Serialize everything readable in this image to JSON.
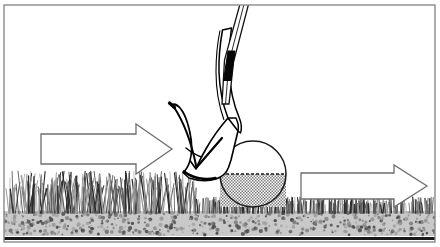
{
  "figure": {
    "kind": "illustration",
    "width": 440,
    "height": 247,
    "background_color": "#ffffff",
    "frame": {
      "label": "illustration-border",
      "stroke_color": "#8a8a8a",
      "stroke_width": 1.4,
      "x": 4,
      "y": 5,
      "width": 431,
      "height": 237
    }
  },
  "colors": {
    "ink": "#000000",
    "frame_gray": "#8a8a8a",
    "arrow_outline": "#6e6e6e",
    "arrow_fill": "#ffffff",
    "grass_dark": "#2b2b2b",
    "grass_mid": "#5e5e5e",
    "grass_light": "#9a9a9a",
    "soil_fill": "#c9c9c9",
    "soil_speck": "#4a4a4a",
    "soil_baseline": "#1a1a1a",
    "ball_outline": "#1a1a1a",
    "ball_upper_fill": "#ffffff",
    "ball_lower_fill": "#b8b8b8",
    "shaft_fill": "#ffffff",
    "shaft_line": "#111111",
    "ferrule_fill": "#050505",
    "clubhead_fill": "#ffffff",
    "clubhead_line": "#000000"
  },
  "scene": {
    "ground": {
      "label": "ground",
      "soil_layer": {
        "label": "soil-layer",
        "top_y": 211,
        "bottom_y": 236,
        "speck_count": 520
      },
      "baseline": {
        "label": "ground-baseline",
        "y": 237,
        "thickness": 3
      },
      "rough": {
        "label": "tall-grass-rough",
        "region": "left",
        "x_start": 6,
        "x_end": 196,
        "top_y": 176,
        "base_y": 212,
        "blade_count": 230,
        "description": "tall thick grass"
      },
      "fairway": {
        "label": "short-grass-fairway",
        "region": "right",
        "x_start": 196,
        "x_end": 433,
        "top_y": 199,
        "base_y": 212,
        "blade_count": 300,
        "description": "short mown grass"
      }
    },
    "ball": {
      "label": "golf-ball",
      "center_x": 253,
      "center_y": 174,
      "radius": 33,
      "equator_line": {
        "label": "ball-equator-dashed-line",
        "y": 174,
        "dash": "3 2"
      },
      "lower_half_shading": "stipple"
    },
    "club": {
      "label": "golf-club-wedge",
      "shaft": {
        "label": "club-shaft",
        "top_x": 244,
        "top_y": 2,
        "bottom_x": 222,
        "bottom_y": 120
      },
      "ferrule": {
        "label": "club-ferrule-band",
        "x": 222,
        "y": 52,
        "width": 14,
        "height": 28
      },
      "head": {
        "label": "club-head",
        "toe_x": 171,
        "toe_y": 105,
        "sole_y": 178,
        "leading_edge_x": 224
      }
    },
    "arrows": [
      {
        "label": "swing-direction-arrow",
        "name": "arrow-left-swing-path",
        "direction": "right",
        "tail_x": 41,
        "tip_x": 172,
        "center_y": 149,
        "shaft_half_height": 15,
        "head_half_height": 25,
        "head_length": 36,
        "style": "outline"
      },
      {
        "label": "ball-flight-arrow",
        "name": "arrow-right-ball-flight",
        "direction": "right",
        "tail_x": 301,
        "tip_x": 427,
        "center_y": 186,
        "shaft_half_height": 13,
        "head_half_height": 21,
        "head_length": 33,
        "style": "outline"
      }
    ]
  }
}
